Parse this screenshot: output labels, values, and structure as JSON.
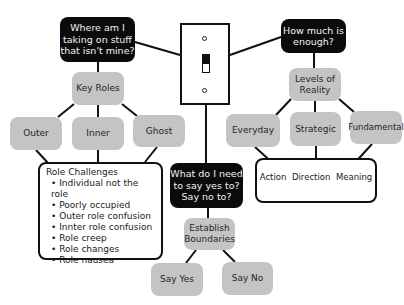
{
  "diagram": {
    "questions": {
      "left": "Where am I taking on stuff that isn't mine?",
      "right": "How much is enough?",
      "center": "What do I need to say yes to? Say no to?"
    },
    "left_branch": {
      "hub": "Key Roles",
      "children": [
        "Outer",
        "Inner",
        "Ghost"
      ],
      "challenges": {
        "title": "Role Challenges",
        "items": [
          "Individual not the role",
          "Poorly occupied",
          "Outer role confusion",
          "Innter role confusion",
          "Role creep",
          "Role changes",
          "Role nausea"
        ]
      }
    },
    "right_branch": {
      "hub": "Levels of Reality",
      "children": [
        "Everyday",
        "Strategic",
        "Fundamental"
      ],
      "outcomes": [
        "Action",
        "Direction",
        "Meaning"
      ]
    },
    "center_branch": {
      "hub": "Establish Boundaries",
      "children": [
        "Say Yes",
        "Say No"
      ]
    },
    "switch_icon": "light-switch",
    "colors": {
      "dark_box": "#0b0b0b",
      "gray_box": "#c4c4c4",
      "line": "#111111"
    }
  }
}
